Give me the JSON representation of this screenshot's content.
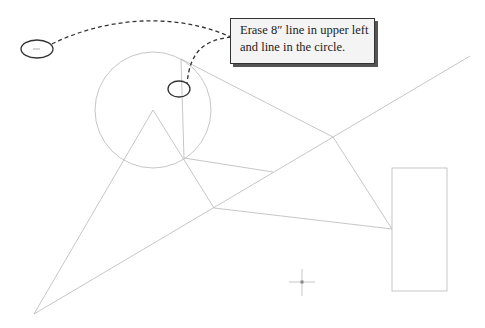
{
  "callout": {
    "line1": "Erase 8″ line in upper left",
    "line2": "and line in the circle."
  },
  "colors": {
    "geometry": "#b8b8b8",
    "annotation": "#333333",
    "callout_bg": "#f4f4f4"
  },
  "shapes": {
    "circle": {
      "cx": 153,
      "cy": 110,
      "r": 58
    },
    "rectangle": {
      "x": 392,
      "y": 168,
      "w": 55,
      "h": 123
    },
    "crosshair": {
      "x": 302,
      "y": 282
    },
    "markers": [
      {
        "name": "upper-left-ellipse",
        "cx": 37,
        "cy": 49
      },
      {
        "name": "circle-line-ellipse",
        "cx": 179,
        "cy": 89
      }
    ]
  }
}
